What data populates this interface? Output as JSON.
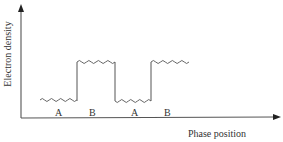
{
  "diagram": {
    "y_axis_label": "Electron density",
    "x_axis_label": "Phase position",
    "segment_labels": [
      "A",
      "B",
      "A",
      "B"
    ],
    "colors": {
      "axis": "#555555",
      "wave": "#666666",
      "text": "#333333"
    }
  }
}
